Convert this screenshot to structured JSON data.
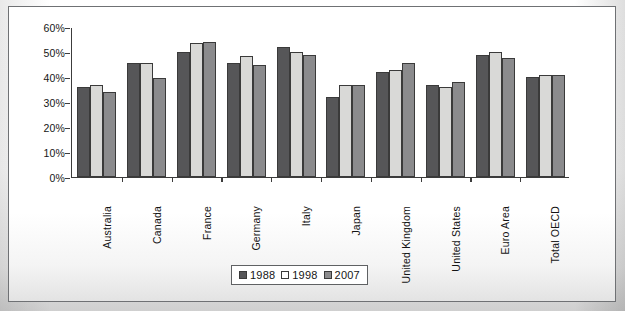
{
  "figure": {
    "frame_border_color": "#6f7174",
    "plot_background": "#ffffff"
  },
  "chart_data": {
    "type": "bar",
    "title": "",
    "subtitle": "",
    "xlabel": "",
    "ylabel": "",
    "ylim": [
      0,
      60
    ],
    "yticks": [
      0,
      10,
      20,
      30,
      40,
      50,
      60
    ],
    "ytick_labels": [
      "0%",
      "10%",
      "20%",
      "30%",
      "40%",
      "50%",
      "60%"
    ],
    "grid": false,
    "legend_position": "bottom-center",
    "categories": [
      "Australia",
      "Canada",
      "France",
      "Germany",
      "Italy",
      "Japan",
      "United Kingdom",
      "United States",
      "Euro Area",
      "Total OECD"
    ],
    "series": [
      {
        "name": "1988",
        "color": "#565658",
        "values": [
          36,
          45.5,
          50,
          45.5,
          52,
          32,
          42,
          37,
          49,
          40
        ]
      },
      {
        "name": "1998",
        "color": "#d9d9d7",
        "values": [
          37,
          45.5,
          53.5,
          48.5,
          50,
          37,
          43,
          36,
          50,
          41
        ]
      },
      {
        "name": "2007",
        "color": "#8b8b8d",
        "values": [
          34,
          39.5,
          54,
          45,
          49,
          37,
          45.5,
          38,
          47.5,
          41
        ]
      }
    ]
  },
  "legend": {
    "items": [
      {
        "label": "1988",
        "swatch": "#565658"
      },
      {
        "label": "1998",
        "swatch": "#ffffff"
      },
      {
        "label": "2007",
        "swatch": "#8b8b8d"
      }
    ]
  }
}
